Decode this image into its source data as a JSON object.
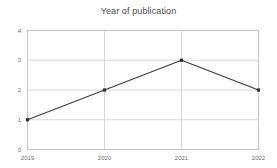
{
  "chart_data": {
    "type": "line",
    "title": "Year of publication",
    "xlabel": "",
    "ylabel": "",
    "categories": [
      "2019",
      "2020",
      "2021",
      "2022"
    ],
    "values": [
      1,
      2,
      3,
      2
    ],
    "x": [
      2019,
      2020,
      2021,
      2022
    ],
    "ylim": [
      0,
      4
    ],
    "ytick_labels": [
      "0",
      "1",
      "2",
      "3",
      "4"
    ],
    "ytick_values": [
      0,
      1,
      2,
      3,
      4
    ],
    "xtick_labels": [
      "2019",
      "2020",
      "2021",
      "2022"
    ],
    "grid": true,
    "grid_axes": "both",
    "legend": false,
    "legend_position": "none",
    "series": [
      {
        "name": "Year of publication",
        "values": [
          1,
          2,
          3,
          2
        ]
      }
    ],
    "marker": "square",
    "annotations": []
  },
  "style": {
    "line_color": "#3d3d3d",
    "marker_color": "#2f2f2f",
    "grid_color": "#d8d8d8",
    "axis_color": "#c4c4c4",
    "title_color": "#4a4a4a",
    "tick_color": "#6b6b6b",
    "background": "#ffffff"
  }
}
